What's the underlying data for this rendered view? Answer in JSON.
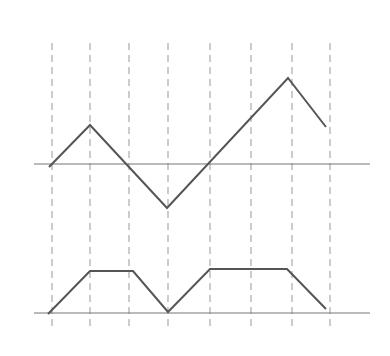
{
  "figure": {
    "colors": {
      "curve": "#555555",
      "axis": "#777777",
      "gridline": "#999999",
      "background": "#ffffff"
    },
    "gridlines_x": [
      52,
      90,
      129,
      168,
      210,
      251,
      292,
      330
    ],
    "gridline_y_range": [
      43,
      328
    ],
    "upper_graph": {
      "axis": {
        "x1": 34,
        "x2": 370,
        "y": 164
      },
      "points": [
        [
          49,
          167
        ],
        [
          90,
          125
        ],
        [
          167,
          208
        ],
        [
          288,
          78
        ],
        [
          326,
          127
        ]
      ]
    },
    "lower_graph": {
      "axis": {
        "x1": 34,
        "x2": 370,
        "y": 313
      },
      "points": [
        [
          48,
          314
        ],
        [
          90,
          271
        ],
        [
          133,
          271
        ],
        [
          168,
          312
        ],
        [
          210,
          269
        ],
        [
          287,
          269
        ],
        [
          326,
          309
        ]
      ]
    }
  }
}
